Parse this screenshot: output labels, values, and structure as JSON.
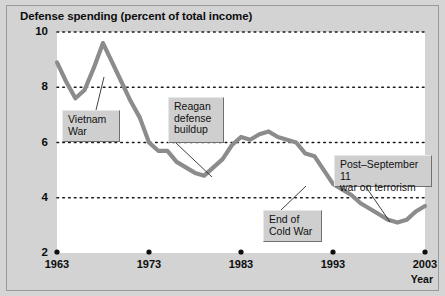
{
  "chart_data": {
    "type": "line",
    "title": "Defense spending (percent of total income)",
    "xlabel": "Year",
    "ylabel": "",
    "xlim": [
      1963,
      2003
    ],
    "ylim": [
      2,
      10
    ],
    "grid": true,
    "legend_position": "none",
    "y_ticks": [
      "10",
      "8",
      "6",
      "4",
      "2"
    ],
    "y_tick_values": [
      10,
      8,
      6,
      4,
      2
    ],
    "x_ticks": [
      "1963",
      "1973",
      "1983",
      "1993",
      "2003"
    ],
    "x_tick_values": [
      1963,
      1973,
      1983,
      1993,
      2003
    ],
    "series": [
      {
        "name": "Defense spending",
        "color": "#8c8c8c",
        "x": [
          1963,
          1964,
          1965,
          1966,
          1967,
          1968,
          1969,
          1970,
          1971,
          1972,
          1973,
          1974,
          1975,
          1976,
          1977,
          1978,
          1979,
          1980,
          1981,
          1982,
          1983,
          1984,
          1985,
          1986,
          1987,
          1988,
          1989,
          1990,
          1991,
          1992,
          1993,
          1994,
          1995,
          1996,
          1997,
          1998,
          1999,
          2000,
          2001,
          2002,
          2003
        ],
        "y": [
          8.9,
          8.2,
          7.6,
          7.9,
          8.7,
          9.6,
          8.9,
          8.2,
          7.5,
          6.9,
          6.0,
          5.7,
          5.7,
          5.3,
          5.1,
          4.9,
          4.8,
          5.1,
          5.4,
          5.9,
          6.2,
          6.1,
          6.3,
          6.4,
          6.2,
          6.1,
          6.0,
          5.6,
          5.5,
          5.0,
          4.5,
          4.3,
          4.1,
          3.8,
          3.6,
          3.4,
          3.2,
          3.1,
          3.2,
          3.5,
          3.7
        ]
      }
    ],
    "annotations": [
      {
        "id": "vietnam-war",
        "text": "Vietnam\nWar",
        "box_left": 62,
        "box_top": 110,
        "box_width": 58,
        "box_height": 32,
        "leader_x1": 96,
        "leader_y1": 110,
        "leader_x2": 104,
        "leader_y2": 77
      },
      {
        "id": "reagan-defense-buildup",
        "text": "Reagan\ndefense\nbuildup",
        "box_left": 168,
        "box_top": 97,
        "box_width": 56,
        "box_height": 46,
        "leader_x1": 176,
        "leader_y1": 143,
        "leader_x2": 212,
        "leader_y2": 177
      },
      {
        "id": "end-of-cold-war",
        "text": "End of\nCold War",
        "box_left": 263,
        "box_top": 210,
        "box_width": 59,
        "box_height": 32,
        "leader_x1": 281,
        "leader_y1": 210,
        "leader_x2": 306,
        "leader_y2": 186
      },
      {
        "id": "post-september-11-war-on-terrorism",
        "text": "Post–September 11\nwar on terrorism",
        "box_left": 334,
        "box_top": 155,
        "box_width": 98,
        "box_height": 32,
        "leader_x1": 366,
        "leader_y1": 187,
        "leader_x2": 390,
        "leader_y2": 222
      }
    ]
  },
  "colors": {
    "line": "#8c8c8c",
    "panel_background": "#d3d3d3",
    "plot_background": "#ffffff",
    "grid": "#1a1a1a",
    "text": "#0d0d0d",
    "annotation_box": "#cfcfcf"
  }
}
